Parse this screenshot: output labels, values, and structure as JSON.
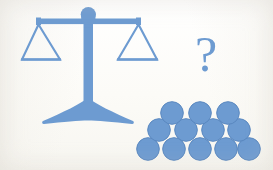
{
  "image": {
    "title": "Balance scale with twelve coins and a question mark",
    "background_color": "#fdfdfb",
    "accent_color": "#6d9bd1",
    "accent_color_dark": "#5a88c0",
    "width": 273,
    "height": 170
  },
  "scale": {
    "label": "balance-scale",
    "state": "balanced",
    "pans": [
      {
        "side": "left",
        "label": "left-pan",
        "contents_count": 0
      },
      {
        "side": "right",
        "label": "right-pan",
        "contents_count": 0
      }
    ],
    "parts": [
      "fulcrum-knob",
      "beam",
      "left-pan",
      "right-pan",
      "post",
      "base"
    ]
  },
  "question": {
    "symbol": "?",
    "label": "question-mark"
  },
  "coins": {
    "label": "coin-pyramid",
    "total": 12,
    "fill_color": "#6d9bd1",
    "stroke_color": "#5a88c0",
    "radius": 11,
    "rows": [
      {
        "row": 1,
        "count": 3,
        "cx": [
          172,
          201,
          230
        ],
        "cy": 113
      },
      {
        "row": 2,
        "count": 4,
        "cx": [
          158,
          187,
          216,
          245
        ],
        "cy": 131
      },
      {
        "row": 3,
        "count": 5,
        "cx": [
          147,
          175,
          203,
          231,
          252
        ],
        "cy": 149
      }
    ]
  }
}
